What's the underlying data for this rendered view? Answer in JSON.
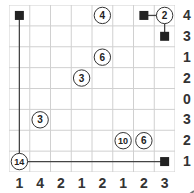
{
  "puzzle": {
    "rows": 8,
    "cols": 8,
    "colors": {
      "grid_line": "#d0d0d0",
      "border": "#c8c8c8",
      "ink": "#222222",
      "clue_text": "#333333",
      "circle_fill": "#ffffff"
    },
    "row_clues": [
      "4",
      "3",
      "1",
      "2",
      "0",
      "3",
      "2",
      "1"
    ],
    "col_clues": [
      "1",
      "4",
      "2",
      "1",
      "2",
      "1",
      "2",
      "3"
    ],
    "circles": [
      {
        "row": 0,
        "col": 4,
        "label": "4"
      },
      {
        "row": 0,
        "col": 7,
        "label": "2"
      },
      {
        "row": 2,
        "col": 4,
        "label": "6"
      },
      {
        "row": 3,
        "col": 3,
        "label": "3"
      },
      {
        "row": 5,
        "col": 1,
        "label": "3"
      },
      {
        "row": 6,
        "col": 5,
        "label": "10"
      },
      {
        "row": 6,
        "col": 6,
        "label": "6"
      },
      {
        "row": 7,
        "col": 0,
        "label": "14"
      }
    ],
    "squares": [
      {
        "row": 0,
        "col": 0
      },
      {
        "row": 0,
        "col": 6
      },
      {
        "row": 1,
        "col": 7
      },
      {
        "row": 7,
        "col": 7
      }
    ],
    "lines": [
      {
        "from": [
          0,
          0
        ],
        "to": [
          7,
          0
        ]
      },
      {
        "from": [
          7,
          0
        ],
        "to": [
          7,
          7
        ]
      },
      {
        "from": [
          0,
          6
        ],
        "to": [
          0,
          7
        ]
      },
      {
        "from": [
          0,
          7
        ],
        "to": [
          1,
          7
        ]
      }
    ]
  }
}
